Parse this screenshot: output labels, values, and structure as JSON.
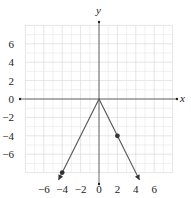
{
  "chart_data": {
    "type": "line",
    "title": "",
    "xlabel": "x",
    "ylabel": "y",
    "xlim": [
      -8,
      8
    ],
    "ylim": [
      -8,
      8
    ],
    "grid": true,
    "x_ticks": [
      "-6",
      "-4",
      "-2",
      "0",
      "2",
      "4",
      "6"
    ],
    "y_ticks": [
      "6",
      "4",
      "2",
      "0",
      "-2",
      "-4",
      "-6"
    ],
    "series": [
      {
        "name": "left ray",
        "points": [
          [
            0,
            0
          ],
          [
            -4,
            -8
          ]
        ],
        "arrow_end": true
      },
      {
        "name": "right ray",
        "points": [
          [
            0,
            0
          ],
          [
            4,
            -8
          ]
        ],
        "arrow_end": true
      }
    ],
    "marked_points": [
      [
        2,
        -4
      ],
      [
        -4,
        -8
      ]
    ],
    "colors": {
      "line": "#555555",
      "grid": "#dddddd",
      "axis": "#444444"
    }
  }
}
